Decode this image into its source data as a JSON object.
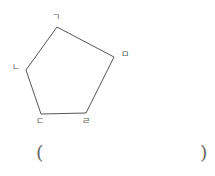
{
  "figure": {
    "type": "pentagon",
    "stroke_color": "#555555",
    "stroke_width": 1,
    "fill": "none",
    "background_color": "#ffffff",
    "label_color": "#585858",
    "vertices": [
      {
        "name": "giyeok",
        "label": "ㄱ",
        "x": 57,
        "y": 27,
        "label_x": 52,
        "label_y": 13
      },
      {
        "name": "mieum",
        "label": "ㅁ",
        "x": 114,
        "y": 57,
        "label_x": 121,
        "label_y": 50
      },
      {
        "name": "rieul",
        "label": "ㄹ",
        "x": 86,
        "y": 113,
        "label_x": 82,
        "label_y": 117
      },
      {
        "name": "digeut",
        "label": "ㄷ",
        "x": 41,
        "y": 114,
        "label_x": 36,
        "label_y": 117
      },
      {
        "name": "nieun",
        "label": "ㄴ",
        "x": 26,
        "y": 70,
        "label_x": 12,
        "label_y": 63
      }
    ],
    "edges": [
      {
        "from": "giyeok",
        "to": "mieum"
      },
      {
        "from": "mieum",
        "to": "rieul"
      },
      {
        "from": "rieul",
        "to": "digeut"
      },
      {
        "from": "digeut",
        "to": "nieun"
      },
      {
        "from": "nieun",
        "to": "giyeok"
      }
    ]
  },
  "answer": {
    "open_paren": "(",
    "close_paren": ")",
    "value": ""
  }
}
